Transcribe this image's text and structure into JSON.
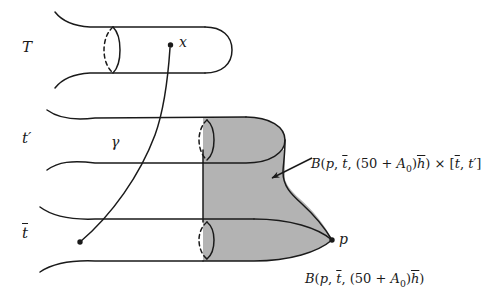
{
  "figure": {
    "type": "mathematical-diagram",
    "background_color": "#ffffff",
    "ink_color": "#1a1a1a",
    "shade_color": "#b3b3b3"
  },
  "axis_labels": {
    "top": "T",
    "middle": "t′",
    "bottom": "t̄"
  },
  "points": {
    "x_label": "x",
    "p_label": "p"
  },
  "curve": {
    "gamma_label": "γ"
  },
  "formulas": {
    "right": "B(p, t̄, (50 + A₀)h̄) × [t̄, t′]",
    "bottom": "B(p, t̄, (50 + A₀)h̄)",
    "right_parts": {
      "B": "B",
      "open": "(",
      "p": "p",
      "comma1": ", ",
      "tbar": "t",
      "comma2": ", ",
      "paren_open": "(",
      "fifty": "50",
      "plus": " + ",
      "A": "A",
      "zero": "0",
      "paren_close": ")",
      "hbar": "h",
      "close": ")",
      "times": " × ",
      "bracket_open": "[",
      "tbar2": "t",
      "comma3": ", ",
      "tprime": "t′",
      "bracket_close": "]"
    },
    "bottom_parts": {
      "B": "B",
      "open": "(",
      "p": "p",
      "comma1": ", ",
      "tbar": "t",
      "comma2": ", ",
      "paren_open": "(",
      "fifty": "50",
      "plus": " + ",
      "A": "A",
      "zero": "0",
      "paren_close": ")",
      "hbar": "h",
      "close": ")"
    }
  },
  "tubes": [
    {
      "name": "top-tube",
      "level": "T",
      "capped": true,
      "shaded": false
    },
    {
      "name": "middle-tube",
      "level": "t′",
      "capped": true,
      "shaded": true
    },
    {
      "name": "bottom-tube",
      "level": "t̄",
      "capped": true,
      "shaded": true
    }
  ]
}
